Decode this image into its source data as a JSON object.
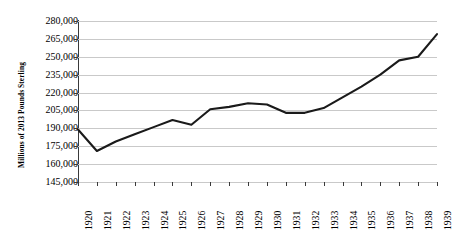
{
  "chart_data": {
    "type": "line",
    "title": "",
    "xlabel": "",
    "ylabel": "Millions of 2013 Pounds Sterling",
    "x": [
      1920,
      1921,
      1922,
      1923,
      1924,
      1925,
      1926,
      1927,
      1928,
      1929,
      1930,
      1931,
      1932,
      1933,
      1934,
      1935,
      1936,
      1937,
      1938,
      1939
    ],
    "values": [
      189000,
      171000,
      179000,
      185000,
      191000,
      197000,
      193000,
      206000,
      208000,
      211000,
      210000,
      203000,
      203000,
      207000,
      216000,
      225000,
      235000,
      247000,
      250000,
      269000
    ],
    "xticklabels": [
      "1920",
      "1921",
      "1922",
      "1923",
      "1924",
      "1925",
      "1926",
      "1927",
      "1928",
      "1929",
      "1930",
      "1931",
      "1932",
      "1933",
      "1934",
      "1935",
      "1936",
      "1937",
      "1938",
      "1939"
    ],
    "yticks": [
      145000,
      160000,
      175000,
      190000,
      205000,
      220000,
      235000,
      250000,
      265000,
      280000
    ],
    "yticklabels": [
      "145,000",
      "160,000",
      "175,000",
      "190,000",
      "205,000",
      "220,000",
      "235,000",
      "250,000",
      "265,000",
      "280,000"
    ],
    "ylim": [
      145000,
      280000
    ],
    "xlim": [
      1920,
      1939
    ],
    "grid": true,
    "grid_axis": "y",
    "legend": false,
    "series_color": "#1a1a1a",
    "grid_color": "#c9c9c9",
    "axis_color": "#3a3a3a",
    "background": "#ffffff"
  }
}
